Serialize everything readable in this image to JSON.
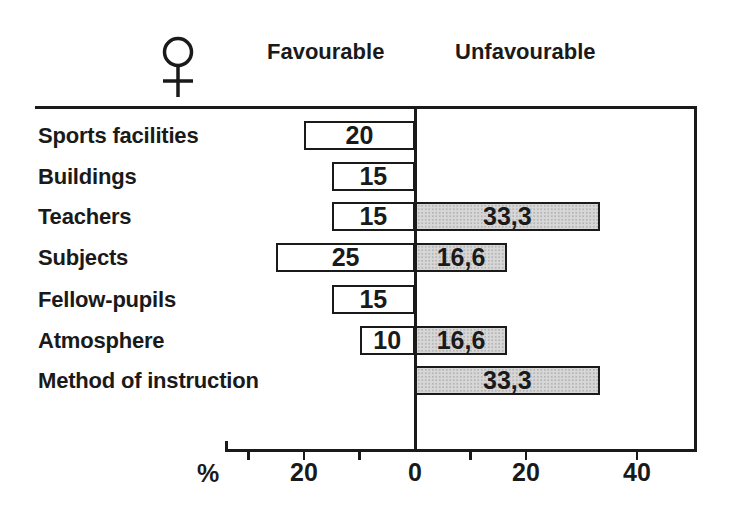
{
  "header": {
    "gender_symbol": "female",
    "favourable_label": "Favourable",
    "unfavourable_label": "Unfavourable"
  },
  "axis": {
    "percent_sign": "%",
    "tick_values": [
      -30,
      -20,
      -10,
      10,
      20,
      40
    ],
    "labels": [
      {
        "value": -20,
        "text": "20"
      },
      {
        "value": 0,
        "text": "0"
      },
      {
        "value": 20,
        "text": "20"
      },
      {
        "value": 40,
        "text": "40"
      }
    ]
  },
  "chart_data": {
    "type": "bar",
    "orientation": "horizontal-diverging",
    "unit": "%",
    "series_names": [
      "Favourable",
      "Unfavourable"
    ],
    "legend_position": "top",
    "grid": false,
    "xlim_left_side": 35,
    "xlim_right_side": 50,
    "categories": [
      "Sports facilities",
      "Buildings",
      "Teachers",
      "Subjects",
      "Fellow-pupils",
      "Atmosphere",
      "Method of instruction"
    ],
    "rows": [
      {
        "category": "Sports facilities",
        "fav": 20,
        "fav_text": "20",
        "unfav": null,
        "unfav_text": ""
      },
      {
        "category": "Buildings",
        "fav": 15,
        "fav_text": "15",
        "unfav": null,
        "unfav_text": ""
      },
      {
        "category": "Teachers",
        "fav": 15,
        "fav_text": "15",
        "unfav": 33.3,
        "unfav_text": "33,3"
      },
      {
        "category": "Subjects",
        "fav": 25,
        "fav_text": "25",
        "unfav": 16.6,
        "unfav_text": "16,6"
      },
      {
        "category": "Fellow-pupils",
        "fav": 15,
        "fav_text": "15",
        "unfav": null,
        "unfav_text": ""
      },
      {
        "category": "Atmosphere",
        "fav": 10,
        "fav_text": "10",
        "unfav": 16.6,
        "unfav_text": "16,6"
      },
      {
        "category": "Method of instruction",
        "fav": null,
        "fav_text": "",
        "unfav": 33.3,
        "unfav_text": "33,3"
      }
    ],
    "colors": {
      "favourable_fill": "#ffffff",
      "unfavourable_fill": "#d7d7d7",
      "line": "#1a1a1a"
    }
  }
}
